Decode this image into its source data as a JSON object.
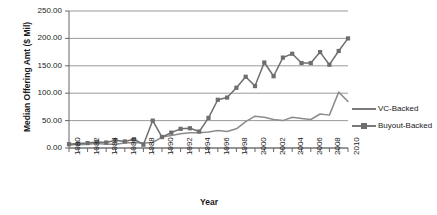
{
  "chart_data": {
    "type": "line",
    "title": "",
    "xlabel": "Year",
    "ylabel": "Median Offering Amt ($ Mil)",
    "xlim": [
      1980,
      2010
    ],
    "ylim": [
      0,
      250
    ],
    "yticks": [
      "0.00",
      "50.00",
      "100.00",
      "150.00",
      "200.00",
      "250.00"
    ],
    "ytick_values": [
      0,
      50,
      100,
      150,
      200,
      250
    ],
    "xticks": [
      "1980",
      "1982",
      "1984",
      "1986",
      "1988",
      "1990",
      "1992",
      "1994",
      "1996",
      "1998",
      "2000",
      "2002",
      "2004",
      "2006",
      "2008",
      "2010"
    ],
    "xtick_values": [
      1980,
      1982,
      1984,
      1986,
      1988,
      1990,
      1992,
      1994,
      1996,
      1998,
      2000,
      2002,
      2004,
      2006,
      2008,
      2010
    ],
    "grid": "horizontal",
    "legend_position": "right",
    "x": [
      1980,
      1981,
      1982,
      1983,
      1984,
      1985,
      1986,
      1987,
      1988,
      1989,
      1990,
      1991,
      1992,
      1993,
      1994,
      1995,
      1996,
      1997,
      1998,
      1999,
      2000,
      2001,
      2002,
      2003,
      2004,
      2005,
      2006,
      2007,
      2008,
      2009,
      2010
    ],
    "series": [
      {
        "name": "VC-Backed",
        "color": "#8c8c8c",
        "marker": "none",
        "values": [
          6,
          6,
          7,
          8,
          7,
          7,
          9,
          10,
          9,
          10,
          20,
          23,
          26,
          28,
          28,
          29,
          32,
          30,
          35,
          48,
          58,
          56,
          52,
          50,
          56,
          54,
          52,
          62,
          60,
          102,
          85
        ]
      },
      {
        "name": "Buyout-Backed",
        "color": "#6e6e6e",
        "marker": "square",
        "values": [
          7,
          8,
          9,
          11,
          10,
          14,
          12,
          16,
          6,
          50,
          20,
          28,
          35,
          36,
          30,
          55,
          88,
          92,
          110,
          130,
          113,
          156,
          131,
          165,
          172,
          155,
          155,
          175,
          152,
          177,
          200
        ]
      }
    ]
  }
}
